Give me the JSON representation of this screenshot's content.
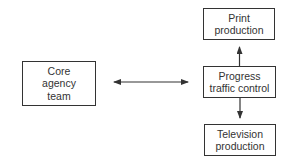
{
  "diagram": {
    "nodes": [
      {
        "id": "core",
        "lines": [
          "Core",
          "agency",
          "team"
        ],
        "x": 22,
        "y": 61,
        "w": 74,
        "h": 45
      },
      {
        "id": "print",
        "lines": [
          "Print",
          "production"
        ],
        "x": 203,
        "y": 8,
        "w": 72,
        "h": 32
      },
      {
        "id": "progress",
        "lines": [
          "Progress",
          "traffic control"
        ],
        "x": 203,
        "y": 66,
        "w": 73,
        "h": 32
      },
      {
        "id": "television",
        "lines": [
          "Television",
          "production"
        ],
        "x": 204,
        "y": 124,
        "w": 72,
        "h": 32
      }
    ],
    "edges": [
      {
        "from": "core",
        "to": "progress",
        "direction": "bidirectional"
      },
      {
        "from": "progress",
        "to": "print",
        "direction": "forward"
      },
      {
        "from": "progress",
        "to": "television",
        "direction": "forward"
      }
    ],
    "colors": {
      "stroke": "#333333",
      "background": "#ffffff",
      "text": "#333333"
    }
  }
}
